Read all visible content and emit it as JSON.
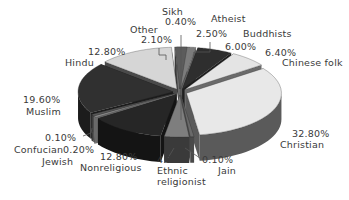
{
  "chart_data": {
    "type": "pie",
    "style": "3d-exploded",
    "title": "",
    "legend": "none",
    "slices": [
      {
        "name": "Sikh",
        "value": 0.4,
        "label": "0.40%",
        "top": "#8a8a8a",
        "side": "#6e6e6e"
      },
      {
        "name": "Atheist",
        "value": 2.5,
        "label": "2.50%",
        "top": "#7c7c7c",
        "side": "#5e5e5e"
      },
      {
        "name": "Buddhists",
        "value": 6.0,
        "label": "6.00%",
        "top": "#2e2e2e",
        "side": "#1e1e1e"
      },
      {
        "name": "Chinese folk",
        "value": 6.4,
        "label": "6.40%",
        "top": "#e4e4e4",
        "side": "#6a6a6a"
      },
      {
        "name": "Christian",
        "value": 32.8,
        "label": "32.80%",
        "top": "#e8e8e8",
        "side": "#5a5a5a"
      },
      {
        "name": "Jain",
        "value": 0.1,
        "label": "0.10%",
        "top": "#6a6a6a",
        "side": "#4a4a4a"
      },
      {
        "name": "Ethnic religionist",
        "value": 4.2,
        "label": "4.20%",
        "top": "#7e7e7e",
        "side": "#3a3a3a"
      },
      {
        "name": "Nonreligious",
        "value": 12.8,
        "label": "12.80%",
        "top": "#262626",
        "side": "#141414"
      },
      {
        "name": "Jewish",
        "value": 0.2,
        "label": "0.20%",
        "top": "#8c8c8c",
        "side": "#6a6a6a"
      },
      {
        "name": "Confucian",
        "value": 0.1,
        "label": "0.10%",
        "top": "#5a5a5a",
        "side": "#3c3c3c"
      },
      {
        "name": "Muslim",
        "value": 19.6,
        "label": "19.60%",
        "top": "#303030",
        "side": "#1c1c1c"
      },
      {
        "name": "Hindu",
        "value": 12.8,
        "label": "12.80%",
        "top": "#d6d6d6",
        "side": "#4a4a4a"
      },
      {
        "name": "Other",
        "value": 2.1,
        "label": "2.10%",
        "top": "#5c5c5c",
        "side": "#3a3a3a"
      }
    ],
    "start_angle_deg": -92,
    "direction": "clockwise"
  },
  "labels": {
    "sikh": {
      "name": "Sikh",
      "pct": "0.40%"
    },
    "atheist": {
      "name": "Atheist",
      "pct": "2.50%"
    },
    "buddhists": {
      "name": "Buddhists",
      "pct": "6.00%"
    },
    "chinese_folk": {
      "name": "Chinese folk",
      "pct": "6.40%"
    },
    "christian": {
      "name": "Christian",
      "pct": "32.80%"
    },
    "jain": {
      "name": "Jain",
      "pct": "0.10%"
    },
    "ethnic": {
      "name1": "Ethnic",
      "name2": "religionist",
      "pct": "4.20%"
    },
    "nonreligious": {
      "name": "Nonreligious",
      "pct": "12.80%"
    },
    "jewish": {
      "name": "Jewish",
      "pct": "0.20%"
    },
    "confucian": {
      "name": "Confucian",
      "pct": "0.10%"
    },
    "muslim": {
      "name": "Muslim",
      "pct": "19.60%"
    },
    "hindu": {
      "name": "Hindu",
      "pct": "12.80%"
    },
    "other": {
      "name": "Other",
      "pct": "2.10%"
    }
  }
}
